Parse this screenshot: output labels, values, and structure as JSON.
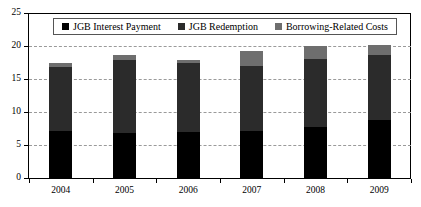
{
  "chart_data": {
    "type": "bar",
    "title": "",
    "xlabel": "",
    "ylabel": "",
    "grid": true,
    "stacked": true,
    "legend_position": "top-inside",
    "categories": [
      "2004",
      "2005",
      "2006",
      "2007",
      "2008",
      "2009"
    ],
    "ylim": [
      0,
      25
    ],
    "yticks": [
      0,
      5,
      10,
      15,
      20,
      25
    ],
    "ytick_labels": [
      "0",
      "5",
      "10",
      "15",
      "20",
      "25"
    ],
    "series": [
      {
        "name": "JGB Interest Payment",
        "color": "#000000",
        "values": [
          7.1,
          6.8,
          6.9,
          7.1,
          7.8,
          8.8
        ]
      },
      {
        "name": "JGB Redemption",
        "color": "#2b2b2b",
        "values": [
          9.7,
          11.1,
          10.6,
          9.9,
          10.2,
          9.8
        ]
      },
      {
        "name": "Borrowing-Related Costs",
        "color": "#6e6e6e",
        "values": [
          0.6,
          0.7,
          0.4,
          2.3,
          2.0,
          1.5
        ]
      }
    ],
    "totals": [
      17.4,
      18.6,
      17.9,
      19.3,
      20.0,
      20.1
    ]
  },
  "legend": {
    "entries": [
      {
        "label": "JGB Interest Payment"
      },
      {
        "label": "JGB Redemption"
      },
      {
        "label": "Borrowing-Related Costs"
      }
    ]
  }
}
